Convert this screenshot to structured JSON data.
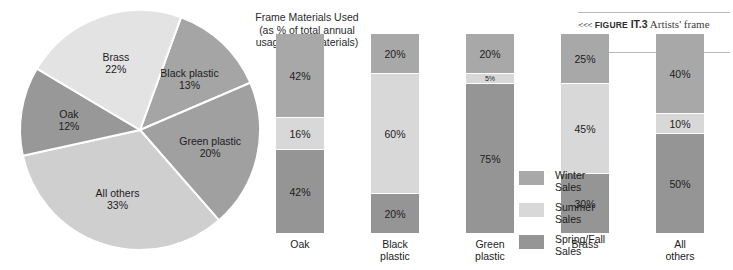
{
  "figure": {
    "chevrons": "<<<",
    "label_word": "Figure",
    "number": "IT.3",
    "caption": "Artists' frame service"
  },
  "pie": {
    "title": "Frame Materials Used\n(as % of total annual\nusage of all materials)"
  },
  "legend": {
    "items": [
      {
        "label": "Winter\nSales",
        "color": "#a8a8a8"
      },
      {
        "label": "Summer\nSales",
        "color": "#d8d8d8"
      },
      {
        "label": "Spring/Fall\nSales",
        "color": "#959595"
      }
    ]
  },
  "chart_data": [
    {
      "type": "pie",
      "title": "Frame Materials Used (as % of total annual usage of all materials)",
      "xlabel": "",
      "ylabel": "",
      "legend_position": "none",
      "grid": false,
      "start_angle_deg": -70,
      "direction": "clockwise",
      "categories": [
        "Black plastic",
        "Green plastic",
        "All others",
        "Oak",
        "Brass"
      ],
      "values": [
        13,
        20,
        33,
        12,
        22
      ],
      "slices": [
        {
          "label": "Black plastic",
          "value": 13,
          "value_text": "13%",
          "color": "#a5a5a5"
        },
        {
          "label": "Green plastic",
          "value": 20,
          "value_text": "20%",
          "color": "#a0a0a0"
        },
        {
          "label": "All others",
          "value": 33,
          "value_text": "33%",
          "color": "#cfcfcf"
        },
        {
          "label": "Oak",
          "value": 12,
          "value_text": "12%",
          "color": "#989898"
        },
        {
          "label": "Brass",
          "value": 22,
          "value_text": "22%",
          "color": "#e3e3e3"
        }
      ]
    },
    {
      "type": "bar",
      "subtype": "stacked",
      "title": "",
      "xlabel": "",
      "ylabel": "",
      "ylim": [
        0,
        100
      ],
      "grid": false,
      "legend_position": "right",
      "categories": [
        "Oak",
        "Black plastic",
        "Green plastic",
        "Brass",
        "All others"
      ],
      "series": [
        {
          "name": "Spring/Fall Sales",
          "color": "#959595",
          "values": [
            42,
            20,
            75,
            30,
            50
          ]
        },
        {
          "name": "Summer Sales",
          "color": "#d8d8d8",
          "values": [
            16,
            60,
            5,
            45,
            10
          ]
        },
        {
          "name": "Winter Sales",
          "color": "#a8a8a8",
          "values": [
            42,
            20,
            20,
            25,
            40
          ]
        }
      ],
      "bars": [
        {
          "category": "Oak",
          "category_label": "Oak",
          "segments": [
            {
              "series": "Winter Sales",
              "value": 42,
              "value_text": "42%",
              "color": "#a8a8a8"
            },
            {
              "series": "Summer Sales",
              "value": 16,
              "value_text": "16%",
              "color": "#d8d8d8"
            },
            {
              "series": "Spring/Fall Sales",
              "value": 42,
              "value_text": "42%",
              "color": "#959595"
            }
          ]
        },
        {
          "category": "Black plastic",
          "category_label": "Black\nplastic",
          "segments": [
            {
              "series": "Winter Sales",
              "value": 20,
              "value_text": "20%",
              "color": "#a8a8a8"
            },
            {
              "series": "Summer Sales",
              "value": 60,
              "value_text": "60%",
              "color": "#d8d8d8"
            },
            {
              "series": "Spring/Fall Sales",
              "value": 20,
              "value_text": "20%",
              "color": "#959595"
            }
          ]
        },
        {
          "category": "Green plastic",
          "category_label": "Green\nplastic",
          "segments": [
            {
              "series": "Winter Sales",
              "value": 20,
              "value_text": "20%",
              "color": "#a8a8a8"
            },
            {
              "series": "Summer Sales",
              "value": 5,
              "value_text": "5%",
              "color": "#d8d8d8"
            },
            {
              "series": "Spring/Fall Sales",
              "value": 75,
              "value_text": "75%",
              "color": "#959595"
            }
          ]
        },
        {
          "category": "Brass",
          "category_label": "Brass",
          "segments": [
            {
              "series": "Winter Sales",
              "value": 25,
              "value_text": "25%",
              "color": "#a8a8a8"
            },
            {
              "series": "Summer Sales",
              "value": 45,
              "value_text": "45%",
              "color": "#d8d8d8"
            },
            {
              "series": "Spring/Fall Sales",
              "value": 30,
              "value_text": "30%",
              "color": "#959595"
            }
          ]
        },
        {
          "category": "All others",
          "category_label": "All\nothers",
          "segments": [
            {
              "series": "Winter Sales",
              "value": 40,
              "value_text": "40%",
              "color": "#a8a8a8"
            },
            {
              "series": "Summer Sales",
              "value": 10,
              "value_text": "10%",
              "color": "#d8d8d8"
            },
            {
              "series": "Spring/Fall Sales",
              "value": 50,
              "value_text": "50%",
              "color": "#959595"
            }
          ]
        }
      ]
    }
  ]
}
